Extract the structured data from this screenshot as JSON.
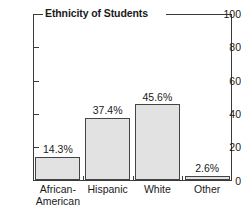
{
  "chart_data": {
    "type": "bar",
    "title": "Ethnicity of Students",
    "xlabel": "",
    "ylabel": "",
    "ylim": [
      0,
      100
    ],
    "yticks": [
      0,
      20,
      40,
      60,
      80,
      100
    ],
    "grid": false,
    "legend": null,
    "categories": [
      "African-\nAmerican",
      "Hispanic",
      "White",
      "Other"
    ],
    "values": [
      14.3,
      37.4,
      45.6,
      2.6
    ],
    "data_labels": [
      "14.3%",
      "37.4%",
      "45.6%",
      "2.6%"
    ],
    "colors": {
      "bar_fill": "#e2e2e2",
      "bar_edge": "#444444",
      "axis": "#3a3a3a",
      "text": "#1a1a1a",
      "background": "#ffffff"
    }
  }
}
